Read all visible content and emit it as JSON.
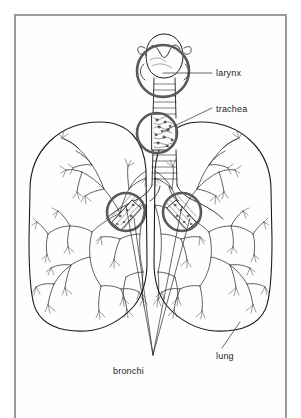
{
  "figure": {
    "kind": "anatomical-diagram",
    "background_color": "#ffffff",
    "frame_color": "#9a9a9a",
    "ink_color": "#1c1c1c",
    "magnifier_ring_color": "#595959"
  },
  "labels": {
    "larynx": "larynx",
    "trachea": "trachea",
    "bronchi": "bronchi",
    "lung": "lung"
  },
  "callouts": [
    {
      "name": "larynx",
      "text": "larynx",
      "text_x": 216,
      "text_y": 69,
      "leader": {
        "from_x": 163,
        "from_y": 73,
        "to_x": 212,
        "to_y": 73
      },
      "magnifier": {
        "cx": 163,
        "cy": 71,
        "r": 27
      }
    },
    {
      "name": "trachea",
      "text": "trachea",
      "text_x": 216,
      "text_y": 105,
      "leader": {
        "from_x": 164,
        "from_y": 131,
        "to_x": 212,
        "to_y": 108
      },
      "magnifier": {
        "cx": 157,
        "cy": 133,
        "r": 21
      }
    },
    {
      "name": "bronchi",
      "text": "bronchi",
      "text_x": 113,
      "text_y": 367,
      "leader_converge_x": 153,
      "leader_converge_y": 355,
      "magnifiers": [
        {
          "cx": 126,
          "cy": 212,
          "r": 20
        },
        {
          "cx": 182,
          "cy": 212,
          "r": 20
        }
      ]
    },
    {
      "name": "lung",
      "text": "lung",
      "text_x": 216,
      "text_y": 352,
      "leader": {
        "from_x": 222,
        "from_y": 348,
        "to_x": 240,
        "to_y": 322
      }
    }
  ],
  "structures": [
    {
      "name": "larynx",
      "description": "rounded larynx body with vocal folds, shown magnified"
    },
    {
      "name": "trachea",
      "description": "ringed windpipe tube with cartilage bands"
    },
    {
      "name": "left-bronchus",
      "description": "main airway entering right-side lung of image"
    },
    {
      "name": "right-bronchus",
      "description": "main airway entering left-side lung of image"
    },
    {
      "name": "left-lung",
      "description": "lung outline filled with branching bronchial tree"
    },
    {
      "name": "right-lung",
      "description": "lung outline filled with branching bronchial tree"
    }
  ]
}
